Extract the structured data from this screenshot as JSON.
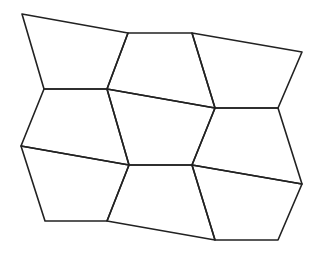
{
  "diagram": {
    "title": "",
    "type": "pentagonal tiling",
    "stroke_color": "#222222",
    "stroke_width": 1.6,
    "background": "#ffffff",
    "cells": [
      {
        "id": "cell-top-left",
        "points": [
          [
            22,
            14
          ],
          [
            128,
            33
          ],
          [
            107,
            89
          ],
          [
            44,
            89
          ]
        ]
      },
      {
        "id": "cell-top-middle",
        "points": [
          [
            128,
            33
          ],
          [
            192,
            33
          ],
          [
            215,
            108
          ],
          [
            107,
            89
          ]
        ]
      },
      {
        "id": "cell-top-right",
        "points": [
          [
            192,
            33
          ],
          [
            302,
            52
          ],
          [
            278,
            108
          ],
          [
            215,
            108
          ]
        ]
      },
      {
        "id": "cell-middle-left",
        "points": [
          [
            44,
            89
          ],
          [
            107,
            89
          ],
          [
            129,
            165
          ],
          [
            21,
            146
          ]
        ]
      },
      {
        "id": "cell-center",
        "points": [
          [
            107,
            89
          ],
          [
            215,
            108
          ],
          [
            192,
            165
          ],
          [
            129,
            165
          ]
        ]
      },
      {
        "id": "cell-middle-right",
        "points": [
          [
            215,
            108
          ],
          [
            278,
            108
          ],
          [
            302,
            184
          ],
          [
            192,
            165
          ]
        ]
      },
      {
        "id": "cell-bottom-left",
        "points": [
          [
            21,
            146
          ],
          [
            129,
            165
          ],
          [
            107,
            221
          ],
          [
            45,
            221
          ]
        ]
      },
      {
        "id": "cell-bottom-middle",
        "points": [
          [
            129,
            165
          ],
          [
            192,
            165
          ],
          [
            215,
            240
          ],
          [
            107,
            221
          ]
        ]
      },
      {
        "id": "cell-bottom-right",
        "points": [
          [
            192,
            165
          ],
          [
            302,
            184
          ],
          [
            278,
            240
          ],
          [
            215,
            240
          ]
        ]
      }
    ]
  }
}
